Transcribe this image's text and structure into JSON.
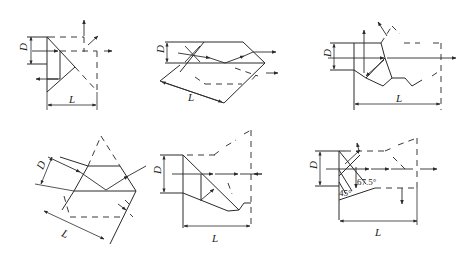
{
  "figure": {
    "panels": [
      {
        "id": "a",
        "dimension_labels": {
          "depth": "D",
          "length": "L"
        }
      },
      {
        "id": "b",
        "dimension_labels": {
          "depth": "D",
          "length": "L"
        }
      },
      {
        "id": "c",
        "dimension_labels": {
          "depth": "D",
          "length": "L"
        }
      },
      {
        "id": "d",
        "dimension_labels": {
          "depth": "D",
          "length": "L"
        }
      },
      {
        "id": "e",
        "dimension_labels": {
          "depth": "D",
          "length": "L"
        }
      },
      {
        "id": "f",
        "dimension_labels": {
          "depth": "D",
          "length": "L"
        },
        "angles": [
          "45°",
          "67.5°"
        ]
      }
    ]
  },
  "colors": {
    "line": "#2a2a2a",
    "background": "#ffffff"
  }
}
